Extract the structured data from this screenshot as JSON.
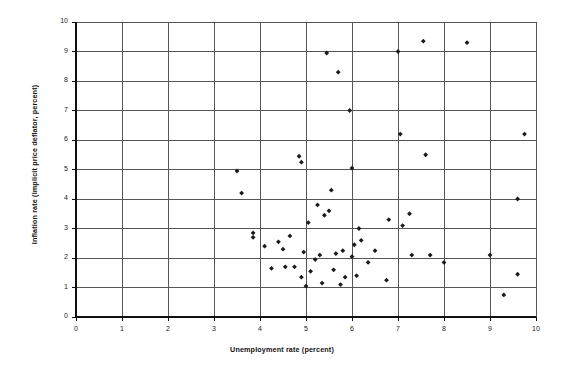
{
  "chart_data": {
    "type": "scatter",
    "title": "",
    "xlabel": "Unemployment rate (percent)",
    "ylabel": "Inflation rate (implicit price deflator, percent)",
    "xlim": [
      0,
      10
    ],
    "ylim": [
      0,
      10
    ],
    "xticks": [
      "0",
      "1",
      "2",
      "3",
      "4",
      "5",
      "6",
      "7",
      "8",
      "9",
      "10"
    ],
    "yticks": [
      "0",
      "1",
      "2",
      "3",
      "4",
      "5",
      "6",
      "7",
      "8",
      "9",
      "10"
    ],
    "grid": true,
    "legend": "none",
    "marker": "filled-diamond",
    "marker_color": "#1a1a1a",
    "points": [
      [
        3.5,
        4.95
      ],
      [
        3.6,
        4.2
      ],
      [
        3.85,
        2.85
      ],
      [
        3.85,
        2.7
      ],
      [
        4.1,
        2.4
      ],
      [
        4.25,
        1.65
      ],
      [
        4.4,
        2.55
      ],
      [
        4.5,
        2.3
      ],
      [
        4.55,
        1.7
      ],
      [
        4.65,
        2.75
      ],
      [
        4.75,
        1.7
      ],
      [
        4.85,
        5.45
      ],
      [
        4.9,
        5.25
      ],
      [
        4.9,
        1.35
      ],
      [
        4.95,
        2.2
      ],
      [
        5.0,
        1.05
      ],
      [
        5.05,
        3.2
      ],
      [
        5.1,
        1.55
      ],
      [
        5.2,
        1.95
      ],
      [
        5.25,
        3.8
      ],
      [
        5.3,
        2.1
      ],
      [
        5.35,
        1.15
      ],
      [
        5.4,
        3.45
      ],
      [
        5.45,
        8.95
      ],
      [
        5.5,
        3.6
      ],
      [
        5.55,
        4.3
      ],
      [
        5.6,
        1.6
      ],
      [
        5.65,
        2.15
      ],
      [
        5.7,
        8.3
      ],
      [
        5.75,
        1.1
      ],
      [
        5.8,
        2.25
      ],
      [
        5.85,
        1.35
      ],
      [
        5.95,
        7.0
      ],
      [
        6.0,
        5.05
      ],
      [
        6.0,
        2.05
      ],
      [
        6.05,
        2.45
      ],
      [
        6.1,
        1.4
      ],
      [
        6.15,
        3.0
      ],
      [
        6.2,
        2.6
      ],
      [
        6.35,
        1.85
      ],
      [
        6.5,
        2.25
      ],
      [
        6.75,
        1.25
      ],
      [
        6.8,
        3.3
      ],
      [
        7.0,
        9.0
      ],
      [
        7.05,
        6.2
      ],
      [
        7.1,
        3.1
      ],
      [
        7.25,
        3.5
      ],
      [
        7.3,
        2.1
      ],
      [
        7.55,
        9.35
      ],
      [
        7.6,
        5.5
      ],
      [
        7.7,
        2.1
      ],
      [
        8.0,
        1.85
      ],
      [
        8.5,
        9.3
      ],
      [
        9.0,
        2.1
      ],
      [
        9.3,
        0.75
      ],
      [
        9.6,
        1.45
      ],
      [
        9.6,
        4.0
      ],
      [
        9.75,
        6.2
      ]
    ]
  },
  "axes": {
    "x_title": "Unemployment rate (percent)",
    "y_title": "Inflation rate (implicit price deflator, percent)"
  }
}
